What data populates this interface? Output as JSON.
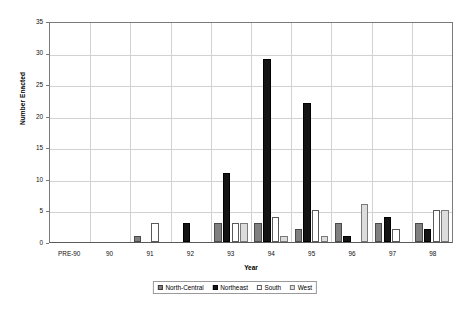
{
  "chart_data": {
    "type": "bar",
    "title": "",
    "xlabel": "Year",
    "ylabel": "Number Enacted",
    "ylim": [
      0,
      35
    ],
    "ytick_step": 5,
    "yticks": [
      0,
      5,
      10,
      15,
      20,
      25,
      30,
      35
    ],
    "grid": true,
    "legend_position": "bottom",
    "categories": [
      "PRE-90",
      "90",
      "91",
      "92",
      "93",
      "94",
      "95",
      "96",
      "97",
      "98"
    ],
    "series": [
      {
        "name": "North-Central",
        "color": "#808080",
        "values": [
          0,
          0,
          1,
          0,
          3,
          3,
          2,
          3,
          3,
          3
        ]
      },
      {
        "name": "Northeast",
        "color": "#141414",
        "values": [
          0,
          0,
          0,
          3,
          11,
          29,
          22,
          1,
          4,
          2
        ]
      },
      {
        "name": "South",
        "color": "#ffffff",
        "values": [
          0,
          0,
          3,
          0,
          3,
          4,
          5,
          0,
          2,
          5
        ]
      },
      {
        "name": "West",
        "color": "#dcdcdc",
        "values": [
          0,
          0,
          0,
          0,
          3,
          1,
          1,
          6,
          0,
          5
        ]
      }
    ]
  },
  "legend": {
    "items": [
      {
        "label": "North-Central"
      },
      {
        "label": "Northeast"
      },
      {
        "label": "South"
      },
      {
        "label": "West"
      }
    ]
  }
}
